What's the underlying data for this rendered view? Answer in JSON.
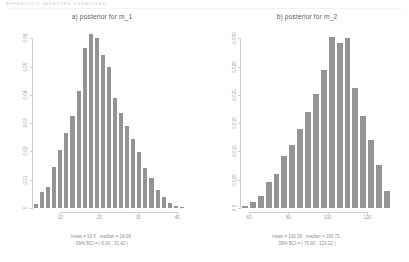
{
  "page": {
    "running_header": "APPENDIX  C   SELECTED  EXERCISES"
  },
  "chart_data": [
    {
      "type": "bar",
      "title": "a) posterior for m_1",
      "xlabel": "",
      "ylabel": "",
      "xticks": [
        "10",
        "20",
        "30",
        "40"
      ],
      "xtick_values": [
        10,
        20,
        30,
        40
      ],
      "yticks": [
        "0",
        "0.01",
        "0.02",
        "0.03",
        "0.04",
        "0.05",
        "0.06"
      ],
      "ytick_values": [
        0,
        0.01,
        0.02,
        0.03,
        0.04,
        0.05,
        0.06
      ],
      "xlim": [
        3,
        42
      ],
      "ylim": [
        0,
        0.063
      ],
      "grid": false,
      "legend": "none",
      "bar_color": "#949494",
      "bin_centers": [
        4.5,
        6,
        7.5,
        9,
        10.5,
        12,
        13.5,
        15,
        16.5,
        18,
        19.5,
        21,
        22.5,
        24,
        25.5,
        27,
        28.5,
        30,
        31.5,
        33,
        34.5,
        36,
        37.5,
        39,
        40.5
      ],
      "values": [
        0.0015,
        0.0055,
        0.0075,
        0.0145,
        0.0205,
        0.0265,
        0.0325,
        0.0415,
        0.0565,
        0.0615,
        0.06,
        0.054,
        0.05,
        0.039,
        0.0335,
        0.029,
        0.0245,
        0.02,
        0.014,
        0.0105,
        0.0065,
        0.004,
        0.0018,
        0.0008,
        0.0004
      ],
      "caption_line1": "mean = 19.5 , median = 19.09 ,",
      "caption_line2": "99% BCI = ( 6.91 , 31.42 )"
    },
    {
      "type": "bar",
      "title": "b) posterior for m_2",
      "xlabel": "",
      "ylabel": "",
      "xticks": [
        "60",
        "80",
        "100",
        "120"
      ],
      "xtick_values": [
        60,
        80,
        100,
        120
      ],
      "yticks": [
        "0.0",
        "0.005",
        "0.010",
        "0.015",
        "0.020",
        "0.025",
        "0.030"
      ],
      "ytick_values": [
        0.0,
        0.005,
        0.01,
        0.015,
        0.02,
        0.025,
        0.03
      ],
      "xlim": [
        56,
        132
      ],
      "ylim": [
        0,
        0.0315
      ],
      "grid": false,
      "legend": "none",
      "bar_color": "#949494",
      "bin_centers": [
        58,
        62,
        66,
        70,
        74,
        78,
        82,
        86,
        90,
        94,
        98,
        102,
        106,
        110,
        114,
        118,
        122,
        126,
        130
      ],
      "values": [
        0.0004,
        0.001,
        0.0022,
        0.0046,
        0.006,
        0.0092,
        0.0112,
        0.014,
        0.017,
        0.0202,
        0.0244,
        0.0302,
        0.0292,
        0.03,
        0.0212,
        0.0162,
        0.012,
        0.0076,
        0.003
      ],
      "caption_line1": "mean = 100.39 , median = 100.73 ,",
      "caption_line2": "99% BCI = ( 75.93 , 123.12 )"
    }
  ]
}
